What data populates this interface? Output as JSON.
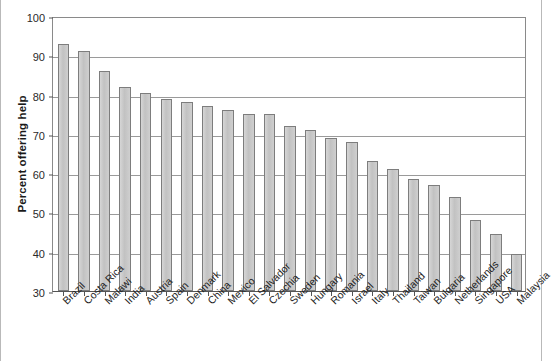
{
  "chart_data": {
    "type": "bar",
    "title": "",
    "subtitle": "",
    "xlabel": "",
    "ylabel": "Percent offering help",
    "ylim": [
      30,
      100
    ],
    "yticks": [
      30,
      40,
      50,
      60,
      70,
      80,
      90,
      100
    ],
    "grid": true,
    "legend": false,
    "legend_position": "none",
    "bar_color": "#c9c9c9",
    "bar_edge_color": "#7d7d7d",
    "categories": [
      "Brazil",
      "Costa Rica",
      "Malawi",
      "India",
      "Austria",
      "Spain",
      "Denmark",
      "China",
      "Mexico",
      "El Salvador",
      "Czechia",
      "Sweden",
      "Hungary",
      "Romania",
      "Israel",
      "Italy",
      "Thailand",
      "Taiwan",
      "Bulgaria",
      "Netherlands",
      "Singapore",
      "USA",
      "Malaysia"
    ],
    "values": [
      93,
      91,
      86,
      82,
      80.5,
      79,
      78,
      77,
      76,
      75,
      75,
      72,
      71,
      69,
      68,
      63,
      61,
      58.5,
      57,
      54,
      48,
      44.5,
      39.5
    ]
  }
}
